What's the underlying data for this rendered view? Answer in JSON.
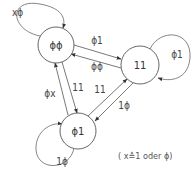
{
  "diagram": {
    "type": "state-transition-diagram",
    "nodes": [
      {
        "id": "s00",
        "label": "ɸɸ",
        "cx": 56,
        "cy": 45,
        "r": 18
      },
      {
        "id": "s11",
        "label": "11",
        "cx": 140,
        "cy": 65,
        "r": 19
      },
      {
        "id": "s01",
        "label": "ɸ1",
        "cx": 78,
        "cy": 131,
        "r": 18
      }
    ],
    "edges": [
      {
        "from": "s00",
        "to": "s00",
        "label": "xɸ"
      },
      {
        "from": "s11",
        "to": "s11",
        "label": "ɸ1"
      },
      {
        "from": "s01",
        "to": "s01",
        "label": "1ɸ"
      },
      {
        "from": "s00",
        "to": "s11",
        "label": "ɸ1"
      },
      {
        "from": "s11",
        "to": "s00",
        "label": "ɸɸ"
      },
      {
        "from": "s01",
        "to": "s00",
        "label": "ɸx"
      },
      {
        "from": "s00",
        "to": "s01",
        "label": "11"
      },
      {
        "from": "s01",
        "to": "s11",
        "label": "11"
      },
      {
        "from": "s11",
        "to": "s01",
        "label": "1ɸ"
      }
    ],
    "legend": "( x≙1 oder ɸ)"
  },
  "colors": {
    "stroke": "#555555",
    "text": "#444444",
    "background": "#ffffff"
  }
}
